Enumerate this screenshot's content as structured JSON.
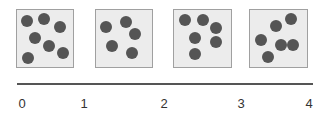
{
  "colors": {
    "box_fill": "#ececec",
    "box_stroke": "#a0a0a0",
    "dot": "#555555",
    "axis": "#555555",
    "label": "#333333"
  },
  "boxes": [
    {
      "x": 16,
      "y": 9,
      "w": 57,
      "h": 58,
      "dots": [
        [
          27,
          21
        ],
        [
          44,
          19
        ],
        [
          60,
          27
        ],
        [
          35,
          38
        ],
        [
          49,
          46
        ],
        [
          63,
          53
        ],
        [
          28,
          58
        ]
      ]
    },
    {
      "x": 95,
      "y": 9,
      "w": 57,
      "h": 58,
      "dots": [
        [
          106,
          27
        ],
        [
          126,
          22
        ],
        [
          135,
          34
        ],
        [
          112,
          46
        ],
        [
          132,
          53
        ]
      ]
    },
    {
      "x": 173,
      "y": 9,
      "w": 58,
      "h": 58,
      "dots": [
        [
          185,
          20
        ],
        [
          203,
          20
        ],
        [
          216,
          28
        ],
        [
          195,
          38
        ],
        [
          216,
          42
        ],
        [
          195,
          54
        ]
      ]
    },
    {
      "x": 249,
      "y": 9,
      "w": 58,
      "h": 58,
      "dots": [
        [
          291,
          19
        ],
        [
          276,
          26
        ],
        [
          261,
          40
        ],
        [
          281,
          45
        ],
        [
          293,
          45
        ],
        [
          268,
          57
        ]
      ]
    }
  ],
  "dot_counts": [
    7,
    5,
    6,
    6
  ],
  "axis": {
    "x1": 17,
    "x2": 313,
    "y": 84,
    "ticks": [
      {
        "label": "0",
        "x": 22
      },
      {
        "label": "1",
        "x": 84
      },
      {
        "label": "2",
        "x": 164
      },
      {
        "label": "3",
        "x": 241
      },
      {
        "label": "4",
        "x": 309
      }
    ]
  }
}
